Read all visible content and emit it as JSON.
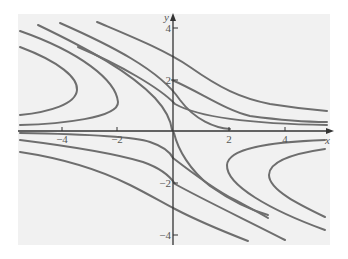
{
  "figure": {
    "type": "phase-portrait",
    "background": "#f1f1f1",
    "curve_color": "#6e6e6e",
    "axis_color": "#333333",
    "x_axis": {
      "label": "x",
      "ticks": [
        {
          "value": -4,
          "label": "−4",
          "px": 62
        },
        {
          "value": -2,
          "label": "−2",
          "px": 117
        },
        {
          "value": 2,
          "label": "2",
          "px": 229
        },
        {
          "value": 4,
          "label": "4",
          "px": 285
        }
      ]
    },
    "y_axis": {
      "label": "y",
      "ticks": [
        {
          "value": 4,
          "label": "4",
          "py": 28
        },
        {
          "value": 2,
          "label": "2",
          "py": 80
        },
        {
          "value": -2,
          "label": "−2",
          "py": 183
        },
        {
          "value": -4,
          "label": "−4",
          "py": 235
        }
      ]
    },
    "curves": [
      {
        "name": "left-inner-hyperbola",
        "d": "M20,47 C60,62 78,78 77,90 C76,104 50,112 20,115"
      },
      {
        "name": "left-outer-hyperbola",
        "d": "M20,31 C80,52 116,80 118,102 C119,118 60,124 20,125"
      },
      {
        "name": "separatrix-upper-left",
        "d": "M38,25 C90,50 130,72 155,98 C166,110 171,122 172,130"
      },
      {
        "name": "upper-curve-1",
        "d": "M60,23 C110,45 160,70 180,100 C195,120 215,128 230,129"
      },
      {
        "name": "upper-curve-2",
        "d": "M78,47 C120,65 160,88 175,104 C200,118 260,124 327,125"
      },
      {
        "name": "upper-curve-3",
        "d": "M97,22 C130,36 165,50 190,67 C220,88 240,98 270,104 C295,108 315,110 327,111"
      },
      {
        "name": "upper-right-mid",
        "d": "M172,80 C200,92 225,110 250,116 C280,120 310,122 327,122"
      },
      {
        "name": "lower-left-top",
        "d": "M20,133 C80,134 133,136 150,142 C162,146 170,152 173,158"
      },
      {
        "name": "lower-left-mid",
        "d": "M20,140 C60,145 110,152 143,162 C160,168 170,176 175,184 C200,198 250,222 285,240"
      },
      {
        "name": "lower-left-bottom",
        "d": "M20,152 C60,158 100,170 130,185 C150,195 165,204 175,209 C200,222 230,234 248,241"
      },
      {
        "name": "separatrix-lower-right",
        "d": "M174,133 C178,150 190,170 210,186 C230,200 250,210 268,215"
      },
      {
        "name": "lower-right-near",
        "d": "M173,158 C195,175 215,190 235,200 C250,208 260,213 268,218"
      },
      {
        "name": "right-outer-hyperbola",
        "d": "M325,140 C270,142 228,148 227,165 C226,185 270,210 325,230"
      },
      {
        "name": "right-inner-hyperbola",
        "d": "M325,149 C290,154 269,162 269,175 C269,190 300,205 325,217"
      }
    ],
    "origin_px": {
      "x": 173,
      "y": 131
    }
  }
}
